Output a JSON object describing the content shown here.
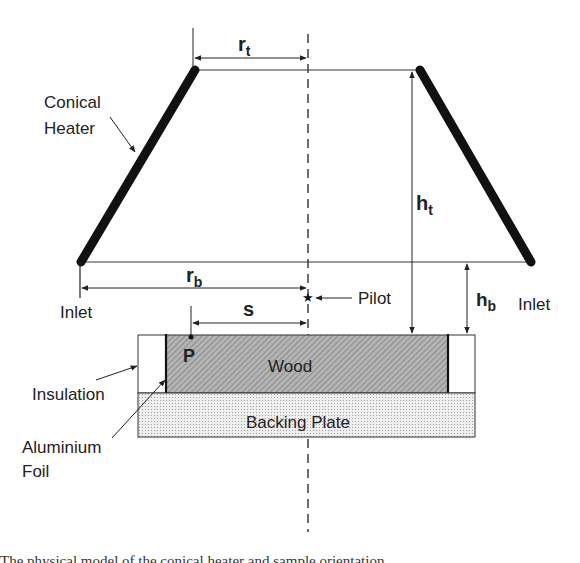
{
  "diagram": {
    "components": {
      "heater": "Conical\nHeater",
      "heater_line1": "Conical",
      "heater_line2": "Heater",
      "wood": "Wood",
      "backing_plate": "Backing Plate",
      "insulation": "Insulation",
      "foil_line1": "Aluminium",
      "foil_line2": "Foil",
      "pilot": "Pilot",
      "point": "P",
      "inlet_left": "Inlet",
      "inlet_right": "Inlet"
    },
    "dimensions": {
      "rt_base": "r",
      "rt_sub": "t",
      "rb_base": "r",
      "rb_sub": "b",
      "ht_base": "h",
      "ht_sub": "t",
      "hb_base": "h",
      "hb_sub": "b",
      "s": "s"
    },
    "colors": {
      "line": "#222222",
      "heater": "#111111",
      "wood_fill": "#a9a9a9",
      "backing_fill": "#e6e6e6",
      "insulation_fill": "#ffffff"
    }
  },
  "caption": "The physical model of the conical heater and sample orientation..."
}
